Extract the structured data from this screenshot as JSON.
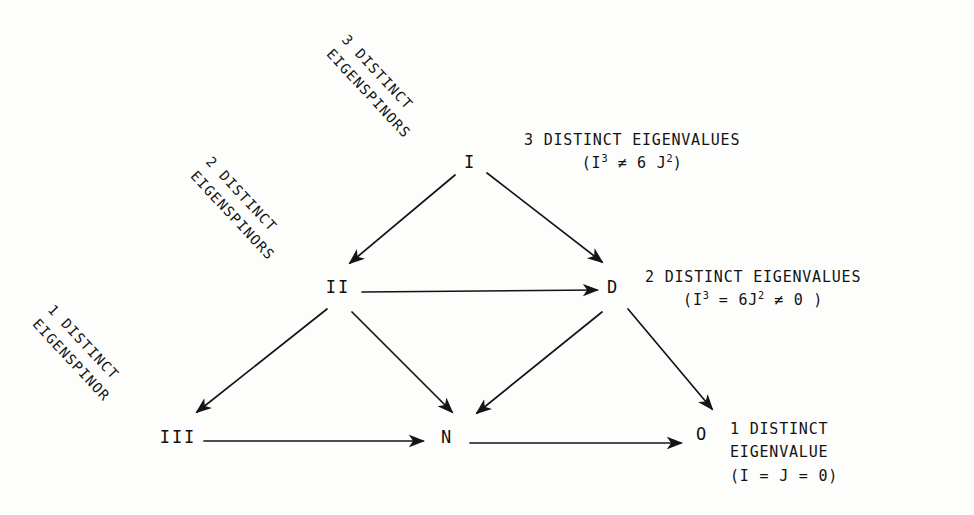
{
  "diagram": {
    "nodes": [
      {
        "id": "I",
        "label": "I",
        "x": 470,
        "y": 162
      },
      {
        "id": "II",
        "label": "II",
        "x": 338,
        "y": 287
      },
      {
        "id": "D",
        "label": "D",
        "x": 613,
        "y": 287
      },
      {
        "id": "III",
        "label": "III",
        "x": 178,
        "y": 437
      },
      {
        "id": "N",
        "label": "N",
        "x": 447,
        "y": 437
      },
      {
        "id": "O",
        "label": "O",
        "x": 702,
        "y": 434
      }
    ],
    "edges": [
      {
        "from": "I",
        "to": "II",
        "x1": 455,
        "y1": 175,
        "x2": 350,
        "y2": 263
      },
      {
        "from": "I",
        "to": "D",
        "x1": 487,
        "y1": 173,
        "x2": 602,
        "y2": 262
      },
      {
        "from": "II",
        "to": "D",
        "x1": 362,
        "y1": 292,
        "x2": 597,
        "y2": 290
      },
      {
        "from": "II",
        "to": "III",
        "x1": 327,
        "y1": 309,
        "x2": 197,
        "y2": 412
      },
      {
        "from": "II",
        "to": "N",
        "x1": 352,
        "y1": 312,
        "x2": 452,
        "y2": 412
      },
      {
        "from": "D",
        "to": "N",
        "x1": 602,
        "y1": 312,
        "x2": 477,
        "y2": 413
      },
      {
        "from": "D",
        "to": "O",
        "x1": 628,
        "y1": 309,
        "x2": 712,
        "y2": 409
      },
      {
        "from": "III",
        "to": "N",
        "x1": 204,
        "y1": 441,
        "x2": 423,
        "y2": 441
      },
      {
        "from": "N",
        "to": "O",
        "x1": 470,
        "y1": 443,
        "x2": 681,
        "y2": 443
      }
    ],
    "rotated_labels": [
      {
        "name": "three-distinct-eigenspinors",
        "line1": "3 DISTINCT",
        "line2": "EIGENSPINORS",
        "x": 352,
        "y": 30
      },
      {
        "name": "two-distinct-eigenspinors",
        "line1": "2 DISTINCT",
        "line2": "EIGENSPINORS",
        "x": 216,
        "y": 152
      },
      {
        "name": "one-distinct-eigenspinor",
        "line1": "1 DISTINCT",
        "line2": "EIGENSPINOR",
        "x": 58,
        "y": 300
      }
    ],
    "eigenvalue_labels": [
      {
        "name": "three-distinct-eigenvalues",
        "x": 524,
        "y": 130,
        "heading": "3 DISTINCT EIGENVALUES",
        "formula_prefix": "(I",
        "formula_sup1": "3",
        "formula_mid": " ≠  6 J",
        "formula_sup2": "2",
        "formula_suffix": ")"
      },
      {
        "name": "two-distinct-eigenvalues",
        "x": 645,
        "y": 267,
        "heading": "2 DISTINCT EIGENVALUES",
        "formula_prefix": "(I",
        "formula_sup1": "3",
        "formula_mid": " = 6J",
        "formula_sup2": "2",
        "formula_suffix": " ≠ 0 )"
      }
    ],
    "bottom_label": {
      "name": "one-distinct-eigenvalue",
      "x": 730,
      "y": 418,
      "line1": "1 DISTINCT",
      "line2": "EIGENVALUE",
      "line3": "(I = J = 0)"
    },
    "colors": {
      "ink": "#141414",
      "paper": "#fdfdfc"
    }
  }
}
